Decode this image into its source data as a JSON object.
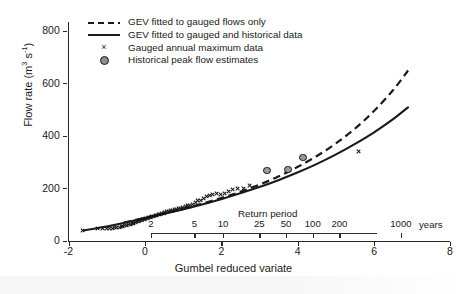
{
  "chart_data": {
    "type": "scatter",
    "title": "",
    "xlabel": "Gumbel reduced variate",
    "ylabel": "Flow rate (m3 s-1)",
    "ylabel_parts": {
      "prefix": "Flow rate (m",
      "sup1": "3",
      "mid": " s",
      "sup2": "-1",
      "suffix": ")"
    },
    "xlim": [
      -2,
      8
    ],
    "ylim": [
      0,
      800
    ],
    "grid": false,
    "legend_position": "top-left",
    "x_ticks": [
      {
        "value": -2,
        "label": "-2"
      },
      {
        "value": 0,
        "label": "0"
      },
      {
        "value": 2,
        "label": "2"
      },
      {
        "value": 4,
        "label": "4"
      },
      {
        "value": 6,
        "label": "6"
      },
      {
        "value": 8,
        "label": "8"
      }
    ],
    "y_ticks": [
      {
        "value": 0,
        "label": "0"
      },
      {
        "value": 200,
        "label": "200"
      },
      {
        "value": 400,
        "label": "400"
      },
      {
        "value": 600,
        "label": "600"
      },
      {
        "value": 800,
        "label": "800"
      }
    ],
    "secondary_axis": {
      "title": "Return period",
      "units": "years",
      "ticks": [
        {
          "label": "2",
          "grv": 0.367
        },
        {
          "label": "5",
          "grv": 1.5
        },
        {
          "label": "10",
          "grv": 2.25
        },
        {
          "label": "25",
          "grv": 3.199
        },
        {
          "label": "50",
          "grv": 3.902
        },
        {
          "label": "100",
          "grv": 4.6
        },
        {
          "label": "200",
          "grv": 5.296
        },
        {
          "label": "1000",
          "grv": 6.907
        }
      ]
    },
    "legend": [
      {
        "key": "dashed-line",
        "label": "GEV fitted to gauged flows only"
      },
      {
        "key": "solid-line",
        "label": "GEV fitted to gauged and historical data"
      },
      {
        "key": "cross",
        "label": "Gauged annual maximum data"
      },
      {
        "key": "circle",
        "label": "Historical peak flow estimates"
      }
    ],
    "series": [
      {
        "name": "GEV fitted to gauged flows only",
        "type": "line",
        "style": "dashed",
        "color": "#1a1a1a",
        "points": [
          [
            -0.55,
            70
          ],
          [
            0.0,
            88
          ],
          [
            0.5,
            104
          ],
          [
            1.0,
            122
          ],
          [
            1.5,
            142
          ],
          [
            2.0,
            163
          ],
          [
            2.5,
            187
          ],
          [
            3.0,
            214
          ],
          [
            3.5,
            245
          ],
          [
            4.0,
            281
          ],
          [
            4.5,
            322
          ],
          [
            5.0,
            370
          ],
          [
            5.5,
            426
          ],
          [
            6.0,
            493
          ],
          [
            6.5,
            572
          ],
          [
            6.9,
            648
          ]
        ]
      },
      {
        "name": "GEV fitted to gauged and historical data",
        "type": "line",
        "style": "solid",
        "color": "#1a1a1a",
        "points": [
          [
            -1.6,
            40
          ],
          [
            -1.0,
            55
          ],
          [
            -0.5,
            70
          ],
          [
            0.0,
            87
          ],
          [
            0.5,
            103
          ],
          [
            1.0,
            120
          ],
          [
            1.5,
            139
          ],
          [
            2.0,
            159
          ],
          [
            2.5,
            181
          ],
          [
            3.0,
            205
          ],
          [
            3.5,
            231
          ],
          [
            4.0,
            260
          ],
          [
            4.5,
            292
          ],
          [
            5.0,
            328
          ],
          [
            5.5,
            368
          ],
          [
            6.0,
            412
          ],
          [
            6.5,
            462
          ],
          [
            6.9,
            508
          ]
        ]
      },
      {
        "name": "Gauged annual maximum data",
        "type": "scatter",
        "marker": "x",
        "color": "#141414",
        "points": [
          [
            -1.62,
            40
          ],
          [
            -1.25,
            46
          ],
          [
            -1.1,
            46
          ],
          [
            -1.0,
            47
          ],
          [
            -0.92,
            48
          ],
          [
            -0.85,
            49
          ],
          [
            -0.79,
            50
          ],
          [
            -0.73,
            51
          ],
          [
            -0.67,
            52
          ],
          [
            -0.62,
            54
          ],
          [
            -0.57,
            56
          ],
          [
            -0.52,
            58
          ],
          [
            -0.47,
            60
          ],
          [
            -0.42,
            62
          ],
          [
            -0.38,
            64
          ],
          [
            -0.33,
            66
          ],
          [
            -0.29,
            68
          ],
          [
            -0.25,
            70
          ],
          [
            -0.21,
            72
          ],
          [
            -0.17,
            74
          ],
          [
            -0.13,
            76
          ],
          [
            -0.09,
            78
          ],
          [
            -0.05,
            80
          ],
          [
            -0.01,
            82
          ],
          [
            0.03,
            84
          ],
          [
            0.07,
            86
          ],
          [
            0.11,
            88
          ],
          [
            0.15,
            90
          ],
          [
            0.19,
            92
          ],
          [
            0.23,
            94
          ],
          [
            0.27,
            96
          ],
          [
            0.31,
            98
          ],
          [
            0.35,
            100
          ],
          [
            0.4,
            102
          ],
          [
            0.44,
            104
          ],
          [
            0.49,
            106
          ],
          [
            0.53,
            108
          ],
          [
            0.58,
            110
          ],
          [
            0.63,
            112
          ],
          [
            0.68,
            114
          ],
          [
            0.73,
            116
          ],
          [
            0.78,
            118
          ],
          [
            0.83,
            120
          ],
          [
            0.89,
            122
          ],
          [
            0.94,
            124
          ],
          [
            1.0,
            127
          ],
          [
            1.06,
            130
          ],
          [
            1.12,
            133
          ],
          [
            1.18,
            136
          ],
          [
            1.25,
            140
          ],
          [
            1.32,
            145
          ],
          [
            1.39,
            152
          ],
          [
            1.46,
            155
          ],
          [
            1.54,
            160
          ],
          [
            1.62,
            168
          ],
          [
            1.7,
            172
          ],
          [
            1.79,
            178
          ],
          [
            1.88,
            182
          ],
          [
            1.98,
            176
          ],
          [
            2.08,
            180
          ],
          [
            2.19,
            188
          ],
          [
            2.31,
            196
          ],
          [
            2.44,
            198
          ],
          [
            2.58,
            200
          ],
          [
            2.74,
            210
          ],
          [
            5.6,
            340
          ]
        ]
      },
      {
        "name": "Historical peak flow estimates",
        "type": "scatter",
        "marker": "o",
        "color": "#141414",
        "points": [
          [
            3.2,
            268
          ],
          [
            3.75,
            272
          ],
          [
            4.15,
            318
          ]
        ]
      }
    ]
  }
}
